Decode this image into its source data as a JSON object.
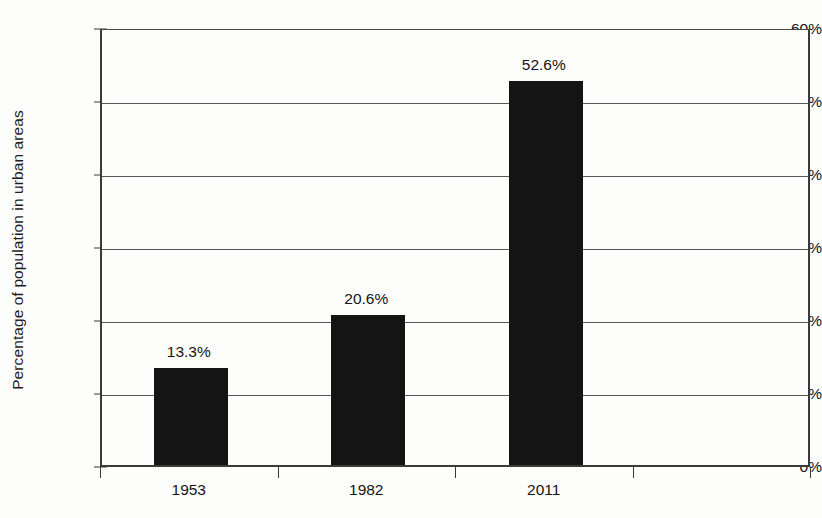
{
  "chart_data": {
    "type": "bar",
    "title": "",
    "xlabel": "",
    "ylabel": "Percentage of population in urban areas",
    "categories": [
      "1953",
      "1982",
      "2011"
    ],
    "values": [
      13.3,
      20.6,
      52.6
    ],
    "value_labels": [
      "13.3%",
      "20.6%",
      "52.6%"
    ],
    "ylim": [
      0,
      60
    ],
    "ytick_values": [
      0,
      10,
      20,
      30,
      40,
      50,
      60
    ],
    "ytick_labels": [
      "0%",
      "10%",
      "20%",
      "30%",
      "40%",
      "50%",
      "60%"
    ],
    "grid": true,
    "legend": "none",
    "bar_color": "#141414",
    "background_color": "#fdfdfc",
    "gridline_color": "#55575a",
    "axis_color": "#3a3a3a",
    "empty_category_slots": 1
  }
}
